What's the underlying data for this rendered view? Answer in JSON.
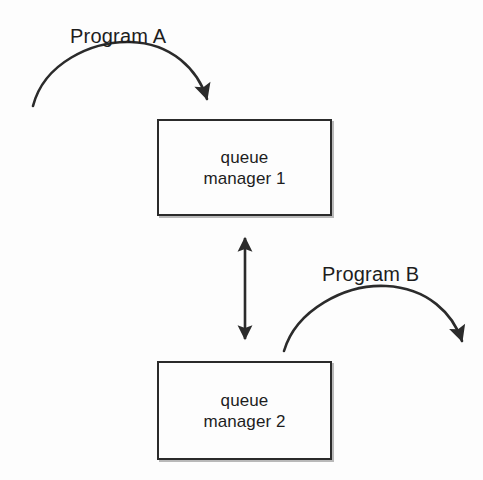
{
  "diagram": {
    "background_color": "#fdfdfd",
    "stroke_color": "#2b2b2b",
    "text_color": "#1d1d1d",
    "nodes": [
      {
        "id": "qm1",
        "label_line1": "queue",
        "label_line2": "manager 1",
        "shape": "rectangle",
        "x": 157,
        "y": 119,
        "width": 175,
        "height": 97
      },
      {
        "id": "qm2",
        "label_line1": "queue",
        "label_line2": "manager 2",
        "shape": "rectangle",
        "x": 157,
        "y": 361,
        "width": 175,
        "height": 99
      }
    ],
    "connectors": [
      {
        "id": "program-a-arc",
        "label": "Program A",
        "style": "curved-arrow",
        "direction": "one-way",
        "from": "program-a-origin",
        "to": "qm1"
      },
      {
        "id": "qm1-qm2-link",
        "label": "",
        "style": "straight-arrow",
        "direction": "two-way",
        "from": "qm1",
        "to": "qm2"
      },
      {
        "id": "program-b-arc",
        "label": "Program B",
        "style": "curved-arrow",
        "direction": "one-way",
        "from": "qm2",
        "to": "program-b-destination"
      }
    ]
  }
}
